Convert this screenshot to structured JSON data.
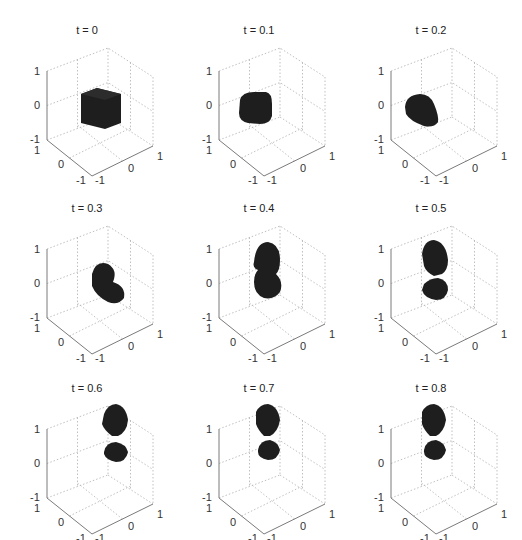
{
  "figure": {
    "rows": 3,
    "cols": 3,
    "background": "#ffffff",
    "surface_color": "#1e1e1e",
    "grid_color": "#b0b0b0",
    "axis_color": "#7a7a7a"
  },
  "chart_data": {
    "type": "3d-isosurface-small-multiples",
    "title": "",
    "panels": [
      {
        "title": "t = 0",
        "t": 0.0,
        "shape": "cube"
      },
      {
        "title": "t = 0.1",
        "t": 0.1,
        "shape": "rounded-cube"
      },
      {
        "title": "t = 0.2",
        "t": 0.2,
        "shape": "rounded-blob"
      },
      {
        "title": "t = 0.3",
        "t": 0.3,
        "shape": "elongated-blob"
      },
      {
        "title": "t = 0.4",
        "t": 0.4,
        "shape": "two-lobes-joined"
      },
      {
        "title": "t = 0.5",
        "t": 0.5,
        "shape": "two-lobes-pinched"
      },
      {
        "title": "t = 0.6",
        "t": 0.6,
        "shape": "two-lobes-pinched"
      },
      {
        "title": "t = 0.7",
        "t": 0.7,
        "shape": "two-lobes-pinched"
      },
      {
        "title": "t = 0.8",
        "t": 0.8,
        "shape": "two-lobes-pinched"
      }
    ],
    "axes": {
      "x": {
        "range": [
          -1,
          1
        ],
        "ticks": [
          "-1",
          "0",
          "1"
        ]
      },
      "y": {
        "range": [
          -1,
          1
        ],
        "ticks": [
          "-1",
          "0",
          "1"
        ]
      },
      "z": {
        "range": [
          -1,
          1
        ],
        "ticks": [
          "-1",
          "0",
          "1"
        ]
      }
    },
    "grid": true,
    "box": "dotted back planes"
  },
  "ticks": {
    "z_top": "1",
    "z_mid": "0",
    "z_bot": "-1",
    "y_top": "1",
    "y_mid": "0",
    "y_bot": "-1",
    "x_left": "-1",
    "x_mid": "0",
    "x_right": "1"
  }
}
